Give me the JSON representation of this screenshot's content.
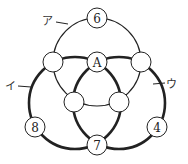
{
  "diagram": {
    "colors": {
      "line": "#222222",
      "background": "#ffffff",
      "node_fill": "#ffffff"
    },
    "circles": [
      {
        "id": "a",
        "label": "ア",
        "cx": 97,
        "cy": 62,
        "r": 44,
        "stroke_width": 1.2
      },
      {
        "id": "i",
        "label": "イ",
        "cx": 75,
        "cy": 103,
        "r": 46,
        "stroke_width": 2.6
      },
      {
        "id": "u",
        "label": "ウ",
        "cx": 119,
        "cy": 103,
        "r": 46,
        "stroke_width": 2.6
      }
    ],
    "nodes": [
      {
        "name": "node-top",
        "x": 97,
        "y": 18,
        "text": "6"
      },
      {
        "name": "node-center-top",
        "x": 97,
        "y": 62,
        "text": "A"
      },
      {
        "name": "node-upper-left",
        "x": 53,
        "y": 62,
        "text": ""
      },
      {
        "name": "node-upper-right",
        "x": 141,
        "y": 62,
        "text": ""
      },
      {
        "name": "node-inner-left",
        "x": 74,
        "y": 102,
        "text": ""
      },
      {
        "name": "node-inner-right",
        "x": 119,
        "y": 102,
        "text": ""
      },
      {
        "name": "node-left",
        "x": 35,
        "y": 127,
        "text": "8"
      },
      {
        "name": "node-right",
        "x": 157,
        "y": 127,
        "text": "4"
      },
      {
        "name": "node-bottom",
        "x": 97,
        "y": 145,
        "text": "7"
      }
    ],
    "labels": [
      {
        "name": "label-a",
        "text": "ア",
        "x": 42,
        "y": 25,
        "line": [
          56,
          22,
          68,
          24
        ]
      },
      {
        "name": "label-i",
        "text": "イ",
        "x": 5,
        "y": 90,
        "line": [
          18,
          86,
          31,
          87
        ]
      },
      {
        "name": "label-u",
        "text": "ウ",
        "x": 166,
        "y": 88,
        "line": [
          153,
          84,
          165,
          83
        ]
      }
    ],
    "node_radius": 10
  }
}
